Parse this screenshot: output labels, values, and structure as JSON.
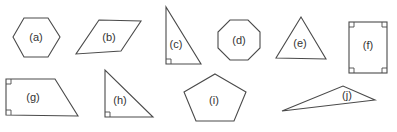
{
  "diagram": {
    "stroke_color": "#4a4a4a",
    "background": "#ffffff",
    "shapes": [
      {
        "id": "a",
        "label": "(a)",
        "type": "regular hexagon"
      },
      {
        "id": "b",
        "label": "(b)",
        "type": "parallelogram"
      },
      {
        "id": "c",
        "label": "(c)",
        "type": "right triangle",
        "right_angle_marks": 1
      },
      {
        "id": "d",
        "label": "(d)",
        "type": "regular octagon"
      },
      {
        "id": "e",
        "label": "(e)",
        "type": "equilateral triangle"
      },
      {
        "id": "f",
        "label": "(f)",
        "type": "rectangle",
        "right_angle_marks": 4
      },
      {
        "id": "g",
        "label": "(g)",
        "type": "right trapezoid",
        "right_angle_marks": 2
      },
      {
        "id": "h",
        "label": "(h)",
        "type": "right triangle",
        "right_angle_marks": 1
      },
      {
        "id": "i",
        "label": "(i)",
        "type": "regular pentagon"
      },
      {
        "id": "j",
        "label": "(j)",
        "type": "obtuse scalene triangle"
      }
    ]
  }
}
